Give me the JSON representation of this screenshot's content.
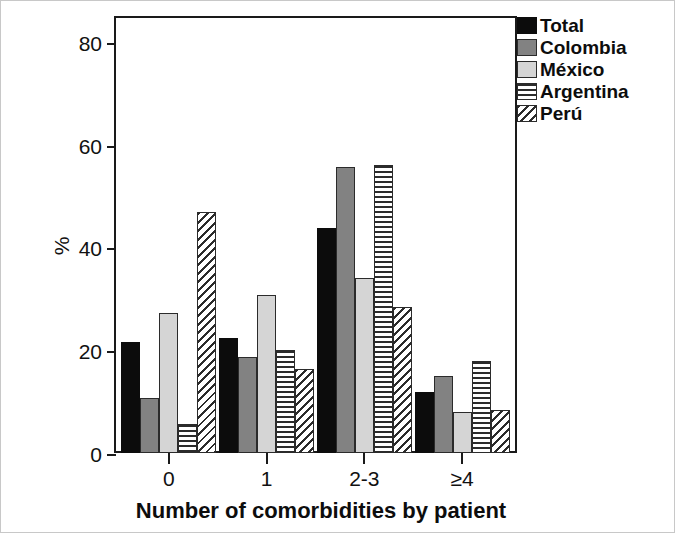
{
  "chart_data": {
    "type": "bar",
    "title": "",
    "xlabel": "Number of comorbidities by patient",
    "ylabel": "%",
    "categories": [
      "0",
      "1",
      "2-3",
      "≥4"
    ],
    "ylim": [
      0,
      85
    ],
    "yticks": [
      0,
      20,
      40,
      60,
      80
    ],
    "ytick_labels": [
      "0",
      "20",
      "40",
      "60",
      "80"
    ],
    "grid": false,
    "legend_position": "top-right",
    "series": [
      {
        "name": "Total",
        "color": "#0c0c0c",
        "pattern": "solid-black",
        "values": [
          21.5,
          22.3,
          43.8,
          11.8
        ]
      },
      {
        "name": "Colombia",
        "color": "#828282",
        "pattern": "solid-gray",
        "values": [
          10.7,
          18.6,
          55.7,
          15.0
        ]
      },
      {
        "name": "México",
        "color": "#d5d5d5",
        "pattern": "solid-light-gray",
        "values": [
          27.3,
          30.7,
          34.0,
          7.9
        ]
      },
      {
        "name": "Argentina",
        "color": "#2b2b2b",
        "pattern": "horizontal-stripes",
        "values": [
          5.6,
          20.0,
          56.0,
          17.9
        ]
      },
      {
        "name": "Perú",
        "color": "#2b2b2b",
        "pattern": "diagonal-hatch",
        "values": [
          46.8,
          16.3,
          28.4,
          8.3
        ]
      }
    ]
  },
  "legend": {
    "items": [
      {
        "label": "Total"
      },
      {
        "label": "Colombia"
      },
      {
        "label": "México"
      },
      {
        "label": "Argentina"
      },
      {
        "label": "Perú"
      }
    ]
  }
}
